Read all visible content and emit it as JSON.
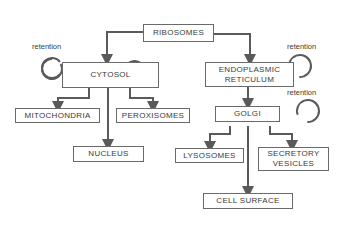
{
  "diagram": {
    "nodes": {
      "ribosomes": "RIBOSOMES",
      "cytosol": "CYTOSOL",
      "er": "ENDOPLASMIC\nRETICULUM",
      "mitochondria": "MITOCHONDRIA",
      "peroxisomes": "PEROXISOMES",
      "nucleus": "NUCLEUS",
      "golgi": "GOLGI",
      "lysosomes": "LYSOSOMES",
      "secretory": "SECRETORY\nVESICLES",
      "cell_surface": "CELL SURFACE"
    },
    "labels": {
      "retention_cytosol": "retention",
      "retention_er": "retention",
      "retention_golgi": "retention"
    },
    "edges": [
      [
        "ribosomes",
        "cytosol"
      ],
      [
        "ribosomes",
        "er"
      ],
      [
        "cytosol",
        "mitochondria"
      ],
      [
        "cytosol",
        "peroxisomes"
      ],
      [
        "cytosol",
        "nucleus"
      ],
      [
        "er",
        "golgi"
      ],
      [
        "golgi",
        "lysosomes"
      ],
      [
        "golgi",
        "secretory"
      ],
      [
        "golgi",
        "cell_surface"
      ]
    ],
    "colors": {
      "line": "#5a5a5a",
      "text": "#3a3a3a"
    }
  }
}
